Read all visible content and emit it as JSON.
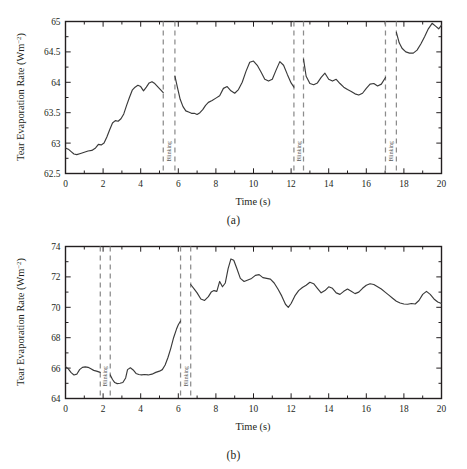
{
  "figure": {
    "panels": [
      {
        "id": "a",
        "caption": "(a)",
        "xlabel": "Time (s)",
        "ylabel_main": "Tear Evaporation Rate (Wm",
        "ylabel_sup": "−2",
        "ylabel_close": ")",
        "ylabel_full": "Tear Evaporation Rate (Wm−2)",
        "blink_label": "Blinking",
        "xticks": [
          "0",
          "2",
          "4",
          "6",
          "8",
          "10",
          "12",
          "14",
          "16",
          "18",
          "20"
        ],
        "yticks": [
          "62.5",
          "63",
          "63.5",
          "64",
          "64.5",
          "65"
        ]
      },
      {
        "id": "b",
        "caption": "(b)",
        "xlabel": "Time (s)",
        "ylabel_main": "Tear Evaporation Rate (Wm",
        "ylabel_sup": "−2",
        "ylabel_close": ")",
        "ylabel_full": "Tear Evaporation Rate (Wm−2)",
        "blink_label": "Blinking",
        "xticks": [
          "0",
          "2",
          "4",
          "6",
          "8",
          "10",
          "12",
          "14",
          "16",
          "18",
          "20"
        ],
        "yticks": [
          "64",
          "66",
          "68",
          "70",
          "72",
          "74"
        ]
      }
    ],
    "colors": {
      "line": "#3a3a3a",
      "axis": "#231f20",
      "blink_line": "#8c8c8c",
      "background": "#ffffff"
    }
  },
  "chart_data": [
    {
      "type": "line",
      "panel": "a",
      "title": "",
      "xlabel": "Time (s)",
      "ylabel": "Tear Evaporation Rate (Wm−2)",
      "xlim": [
        0,
        20
      ],
      "ylim": [
        62.5,
        65
      ],
      "xticks": [
        0,
        2,
        4,
        6,
        8,
        10,
        12,
        14,
        16,
        18,
        20
      ],
      "yticks": [
        62.5,
        63,
        63.5,
        64,
        64.5,
        65
      ],
      "grid": false,
      "legend": false,
      "annotations": [
        {
          "label": "Blinking",
          "type": "blink-interval",
          "x_start": 5.2,
          "x_end": 5.82
        },
        {
          "label": "Blinking",
          "type": "blink-interval",
          "x_start": 12.15,
          "x_end": 12.66
        },
        {
          "label": "Blinking",
          "type": "blink-interval",
          "x_start": 17.02,
          "x_end": 17.6
        }
      ],
      "series": [
        {
          "name": "Tear evaporation rate",
          "x": [
            0.0,
            0.15,
            0.3,
            0.45,
            0.6,
            0.8,
            1.0,
            1.2,
            1.4,
            1.6,
            1.75,
            1.9,
            2.05,
            2.2,
            2.35,
            2.5,
            2.65,
            2.8,
            2.95,
            3.1,
            3.25,
            3.4,
            3.55,
            3.7,
            3.85,
            4.0,
            4.15,
            4.3,
            4.45,
            4.6,
            4.75,
            4.9,
            5.05,
            5.2,
            5.82,
            5.95,
            6.1,
            6.25,
            6.4,
            6.55,
            6.7,
            6.85,
            7.0,
            7.15,
            7.3,
            7.45,
            7.6,
            7.8,
            8.0,
            8.2,
            8.4,
            8.6,
            8.8,
            9.0,
            9.2,
            9.4,
            9.6,
            9.8,
            10.0,
            10.2,
            10.4,
            10.6,
            10.8,
            11.0,
            11.2,
            11.4,
            11.6,
            11.8,
            12.0,
            12.15,
            12.66,
            12.8,
            13.0,
            13.2,
            13.4,
            13.6,
            13.8,
            14.0,
            14.2,
            14.4,
            14.6,
            14.8,
            15.0,
            15.2,
            15.4,
            15.6,
            15.8,
            16.0,
            16.2,
            16.4,
            16.6,
            16.8,
            17.02,
            17.6,
            17.75,
            17.9,
            18.1,
            18.3,
            18.5,
            18.7,
            18.9,
            19.1,
            19.3,
            19.5,
            19.7,
            19.85,
            20.0
          ],
          "y": [
            62.92,
            62.9,
            62.86,
            62.82,
            62.81,
            62.83,
            62.85,
            62.87,
            62.88,
            62.92,
            62.98,
            62.97,
            63.0,
            63.1,
            63.22,
            63.33,
            63.37,
            63.36,
            63.4,
            63.48,
            63.62,
            63.75,
            63.87,
            63.92,
            63.95,
            63.93,
            63.86,
            63.92,
            63.99,
            64.01,
            63.98,
            63.93,
            63.88,
            63.83,
            64.1,
            63.92,
            63.72,
            63.6,
            63.53,
            63.51,
            63.49,
            63.49,
            63.47,
            63.5,
            63.55,
            63.62,
            63.67,
            63.7,
            63.74,
            63.78,
            63.9,
            63.93,
            63.86,
            63.82,
            63.88,
            64.0,
            64.18,
            64.33,
            64.35,
            64.28,
            64.17,
            64.05,
            64.02,
            64.05,
            64.2,
            64.34,
            64.28,
            64.13,
            63.99,
            63.92,
            64.38,
            64.1,
            63.98,
            63.96,
            63.99,
            64.08,
            64.15,
            64.05,
            64.02,
            64.05,
            63.98,
            63.92,
            63.88,
            63.85,
            63.81,
            63.79,
            63.82,
            63.9,
            63.97,
            63.98,
            63.94,
            63.97,
            64.08,
            64.82,
            64.65,
            64.56,
            64.5,
            64.48,
            64.48,
            64.53,
            64.63,
            64.75,
            64.88,
            64.97,
            64.92,
            64.88,
            64.94
          ]
        }
      ]
    },
    {
      "type": "line",
      "panel": "b",
      "title": "",
      "xlabel": "Time (s)",
      "ylabel": "Tear Evaporation Rate (Wm−2)",
      "xlim": [
        0,
        20
      ],
      "ylim": [
        64,
        74
      ],
      "xticks": [
        0,
        2,
        4,
        6,
        8,
        10,
        12,
        14,
        16,
        18,
        20
      ],
      "yticks": [
        64,
        66,
        68,
        70,
        72,
        74
      ],
      "grid": false,
      "legend": false,
      "annotations": [
        {
          "label": "Blinking",
          "type": "blink-interval",
          "x_start": 1.85,
          "x_end": 2.38
        },
        {
          "label": "Blinking",
          "type": "blink-interval",
          "x_start": 6.12,
          "x_end": 6.66
        }
      ],
      "series": [
        {
          "name": "Tear evaporation rate",
          "x": [
            0.0,
            0.15,
            0.3,
            0.45,
            0.6,
            0.75,
            0.9,
            1.05,
            1.2,
            1.35,
            1.5,
            1.65,
            1.85,
            2.38,
            2.5,
            2.62,
            2.75,
            2.9,
            3.05,
            3.2,
            3.3,
            3.45,
            3.6,
            3.75,
            3.9,
            4.05,
            4.2,
            4.4,
            4.6,
            4.8,
            5.0,
            5.15,
            5.3,
            5.45,
            5.6,
            5.75,
            5.9,
            6.0,
            6.12,
            6.66,
            6.85,
            7.0,
            7.2,
            7.4,
            7.6,
            7.75,
            7.9,
            8.05,
            8.2,
            8.35,
            8.5,
            8.65,
            8.8,
            8.95,
            9.1,
            9.3,
            9.5,
            9.7,
            9.9,
            10.1,
            10.3,
            10.5,
            10.7,
            10.9,
            11.1,
            11.3,
            11.5,
            11.7,
            11.85,
            12.0,
            12.2,
            12.4,
            12.6,
            12.8,
            13.0,
            13.2,
            13.4,
            13.6,
            13.8,
            14.0,
            14.2,
            14.4,
            14.6,
            14.8,
            15.0,
            15.2,
            15.4,
            15.6,
            15.8,
            16.0,
            16.2,
            16.4,
            16.6,
            16.8,
            17.0,
            17.2,
            17.4,
            17.6,
            17.8,
            18.0,
            18.2,
            18.4,
            18.6,
            18.8,
            19.0,
            19.2,
            19.4,
            19.6,
            19.8,
            20.0
          ],
          "y": [
            66.1,
            65.95,
            65.7,
            65.55,
            65.6,
            65.9,
            66.05,
            66.08,
            66.05,
            65.95,
            65.85,
            65.8,
            65.72,
            65.55,
            65.25,
            65.05,
            64.98,
            65.0,
            65.05,
            65.35,
            65.9,
            66.02,
            65.88,
            65.65,
            65.58,
            65.55,
            65.58,
            65.55,
            65.6,
            65.72,
            65.8,
            65.9,
            66.2,
            66.7,
            67.3,
            68.0,
            68.55,
            68.85,
            69.1,
            71.5,
            71.2,
            70.95,
            70.55,
            70.45,
            70.7,
            71.0,
            71.1,
            71.05,
            71.7,
            71.35,
            71.6,
            72.55,
            73.18,
            73.1,
            72.6,
            71.9,
            71.7,
            71.8,
            71.9,
            72.1,
            72.15,
            71.95,
            71.9,
            71.85,
            71.6,
            71.2,
            70.75,
            70.2,
            70.0,
            70.25,
            70.75,
            71.1,
            71.3,
            71.45,
            71.65,
            71.55,
            71.25,
            70.95,
            71.1,
            71.35,
            71.25,
            70.95,
            70.85,
            71.05,
            71.2,
            71.05,
            70.9,
            71.0,
            71.25,
            71.45,
            71.55,
            71.5,
            71.35,
            71.2,
            71.0,
            70.8,
            70.6,
            70.4,
            70.28,
            70.22,
            70.2,
            70.25,
            70.22,
            70.45,
            70.85,
            71.05,
            70.85,
            70.55,
            70.35,
            70.25
          ]
        }
      ]
    }
  ]
}
